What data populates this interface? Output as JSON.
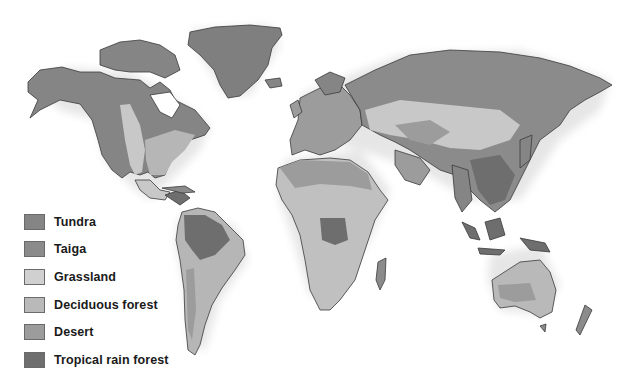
{
  "map": {
    "type": "world biome map",
    "regions": [
      "North America",
      "Greenland",
      "South America",
      "Europe",
      "Africa",
      "Asia",
      "Australia",
      "New Zealand",
      "Indonesia",
      "Madagascar"
    ]
  },
  "legend": {
    "items": [
      {
        "label": "Tundra",
        "color": "#858585"
      },
      {
        "label": "Taiga",
        "color": "#8b8b8b"
      },
      {
        "label": "Grassland",
        "color": "#d0d0d0"
      },
      {
        "label": "Deciduous forest",
        "color": "#b9b9b9"
      },
      {
        "label": "Desert",
        "color": "#9c9c9c"
      },
      {
        "label": "Tropical rain forest",
        "color": "#6e6e6e"
      }
    ]
  }
}
